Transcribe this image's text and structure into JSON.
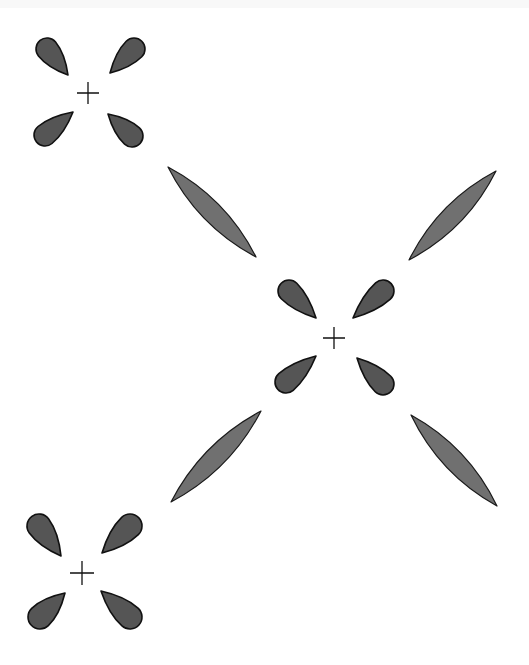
{
  "diagram": {
    "colors": {
      "background": "#ffffff",
      "small_lobe_fill": "#555555",
      "long_lobe_fill": "#707070",
      "outline": "#111111"
    },
    "atoms": [
      {
        "name": "atom-top-left",
        "center": [
          88,
          93
        ],
        "plus_arm": 11,
        "lobes": [
          {
            "round": [
              47,
              49
            ],
            "tip": [
              68,
              75
            ],
            "r": 11
          },
          {
            "round": [
              134,
              49
            ],
            "tip": [
              110,
              73
            ],
            "r": 11
          },
          {
            "round": [
              45,
              135
            ],
            "tip": [
              73,
              112
            ],
            "r": 11
          },
          {
            "round": [
              132,
              136
            ],
            "tip": [
              108,
              114
            ],
            "r": 11
          }
        ]
      },
      {
        "name": "atom-center",
        "center": [
          334,
          338
        ],
        "plus_arm": 11,
        "lobes": [
          {
            "round": [
              289,
              291
            ],
            "tip": [
              316,
              318
            ],
            "r": 11
          },
          {
            "round": [
              383,
              291
            ],
            "tip": [
              353,
              318
            ],
            "r": 11
          },
          {
            "round": [
              286,
              382
            ],
            "tip": [
              316,
              356
            ],
            "r": 11
          },
          {
            "round": [
              383,
              384
            ],
            "tip": [
              357,
              358
            ],
            "r": 11
          }
        ]
      },
      {
        "name": "atom-bottom-left",
        "center": [
          82,
          573
        ],
        "plus_arm": 12,
        "lobes": [
          {
            "round": [
              39,
              526
            ],
            "tip": [
              61,
              556
            ],
            "r": 12
          },
          {
            "round": [
              130,
              526
            ],
            "tip": [
              102,
              553
            ],
            "r": 12
          },
          {
            "round": [
              40,
              617
            ],
            "tip": [
              65,
              593
            ],
            "r": 12
          },
          {
            "round": [
              130,
              617
            ],
            "tip": [
              101,
              591
            ],
            "r": 12
          }
        ]
      }
    ],
    "bonding_lobes": [
      {
        "name": "long-lobe-top-left",
        "from": [
          168,
          167
        ],
        "to": [
          256,
          257
        ],
        "width": 20
      },
      {
        "name": "long-lobe-top-right",
        "from": [
          409,
          260
        ],
        "to": [
          496,
          171
        ],
        "width": 20
      },
      {
        "name": "long-lobe-bottom-left",
        "from": [
          171,
          502
        ],
        "to": [
          261,
          411
        ],
        "width": 20
      },
      {
        "name": "long-lobe-bottom-right",
        "from": [
          411,
          415
        ],
        "to": [
          497,
          506
        ],
        "width": 20
      }
    ]
  }
}
